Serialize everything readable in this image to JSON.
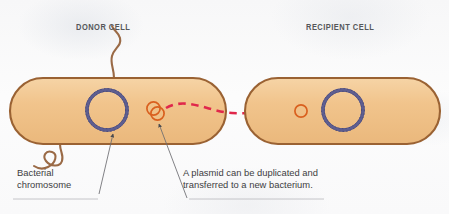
{
  "figure": {
    "labels": {
      "donor_cell": "DONOR CELL",
      "recipient_cell": "RECIPIENT CELL"
    },
    "annotations": {
      "chromosome_line1": "Bacterial",
      "chromosome_line2": "chromosome",
      "plasmid_line1": "A plasmid can be duplicated and",
      "plasmid_line2": "transferred to a new bacterium."
    }
  },
  "colors": {
    "background": "#f9f9fa",
    "cell_fill": "#f0c086",
    "cell_fill_light": "#f5d2a4",
    "cell_outline": "#9a6233",
    "chromosome": "#4a4a7a",
    "plasmid": "#d9601f",
    "transfer_arrow": "#e0274b",
    "flagellum": "#9a6a46",
    "leader_line": "#6b6b70",
    "label_text": "#55575a",
    "annotation_text": "#3d3d3f",
    "rule": "#b8b8bc"
  },
  "shapes": {
    "donor_cell": {
      "x": 10,
      "y": 78,
      "width": 216,
      "height": 66,
      "radius": 33
    },
    "recipient_cell": {
      "x": 245,
      "y": 78,
      "width": 195,
      "height": 66,
      "radius": 33
    },
    "donor_chromosome": {
      "cx": 107,
      "cy": 110,
      "r": 20
    },
    "recipient_chromosome": {
      "cx": 343,
      "cy": 110,
      "r": 20
    },
    "donor_plasmid_a": {
      "cx": 154,
      "cy": 110,
      "r": 6.5
    },
    "donor_plasmid_b": {
      "cx": 158,
      "cy": 114,
      "r": 6.5
    },
    "recipient_plasmid": {
      "cx": 301,
      "cy": 111,
      "r": 6.0
    },
    "transfer_arrow": {
      "x1": 167,
      "y1": 110,
      "x2": 290,
      "y2": 112
    }
  }
}
